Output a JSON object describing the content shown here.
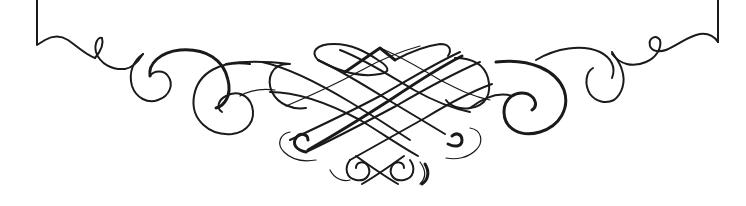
{
  "image": {
    "description": "Decorative calligraphic flourish ornament (frame bottom border)",
    "colors": {
      "background": "#ffffff",
      "ink": "#1a1a1a"
    },
    "elements": [
      {
        "name": "left-frame-edge",
        "shape": "vertical line with corner hook"
      },
      {
        "name": "left-flourish",
        "shape": "wavy line with small loop and spirals"
      },
      {
        "name": "center-lattice",
        "shape": "interlaced diagonal crossing strokes with loops"
      },
      {
        "name": "right-flourish",
        "shape": "wavy line with small loop and spirals"
      },
      {
        "name": "right-frame-edge",
        "shape": "vertical line with corner hook"
      }
    ]
  }
}
